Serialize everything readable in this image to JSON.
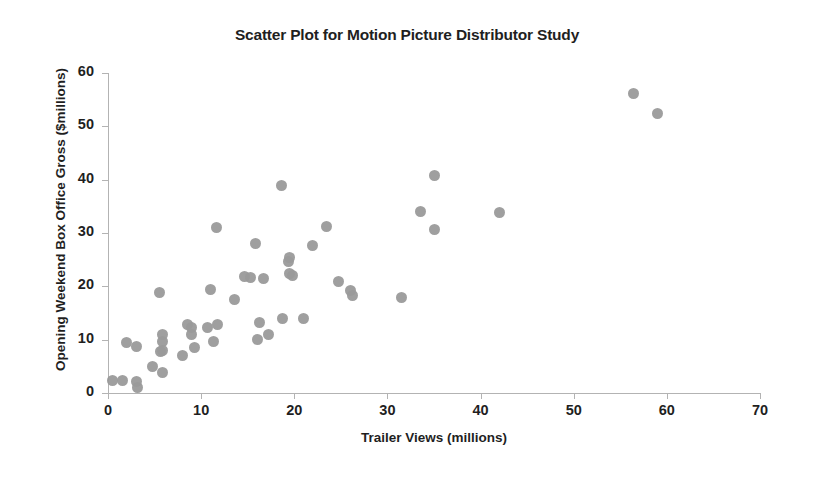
{
  "chart_data": {
    "type": "scatter",
    "title": "Scatter Plot for Motion Picture Distributor Study",
    "xlabel": "Trailer Views (millions)",
    "ylabel": "Opening Weekend Box Office Gross ($millions)",
    "xlim": [
      0,
      70
    ],
    "ylim": [
      0,
      60
    ],
    "xticks": [
      0,
      10,
      20,
      30,
      40,
      50,
      60,
      70
    ],
    "yticks": [
      0,
      10,
      20,
      30,
      40,
      50,
      60
    ],
    "grid": false,
    "legend": null,
    "marker": {
      "shape": "circle",
      "color": "#9a9a9a",
      "size": 11
    },
    "series": [
      {
        "name": "Motion pictures",
        "points": [
          [
            0.5,
            2.4
          ],
          [
            1.6,
            2.3
          ],
          [
            2.0,
            9.4
          ],
          [
            3.1,
            8.8
          ],
          [
            3.1,
            2.1
          ],
          [
            3.2,
            1.1
          ],
          [
            4.8,
            4.9
          ],
          [
            5.5,
            18.8
          ],
          [
            5.6,
            7.7
          ],
          [
            5.8,
            9.6
          ],
          [
            5.8,
            10.9
          ],
          [
            5.9,
            8.0
          ],
          [
            5.9,
            3.8
          ],
          [
            8.0,
            7.1
          ],
          [
            8.5,
            12.8
          ],
          [
            9.0,
            12.2
          ],
          [
            9.0,
            10.9
          ],
          [
            9.3,
            8.6
          ],
          [
            10.7,
            12.2
          ],
          [
            11.0,
            19.5
          ],
          [
            11.3,
            9.6
          ],
          [
            11.7,
            31.0
          ],
          [
            11.8,
            12.8
          ],
          [
            13.6,
            17.5
          ],
          [
            14.7,
            21.8
          ],
          [
            15.3,
            21.6
          ],
          [
            15.8,
            28.0
          ],
          [
            16.0,
            10.0
          ],
          [
            16.3,
            13.3
          ],
          [
            16.7,
            21.4
          ],
          [
            17.2,
            11.0
          ],
          [
            18.6,
            39.0
          ],
          [
            18.7,
            14.0
          ],
          [
            19.4,
            24.6
          ],
          [
            19.5,
            25.5
          ],
          [
            19.8,
            22.0
          ],
          [
            19.5,
            22.5
          ],
          [
            21.0,
            14.0
          ],
          [
            22.0,
            27.7
          ],
          [
            23.5,
            31.3
          ],
          [
            24.7,
            21.0
          ],
          [
            26.0,
            19.3
          ],
          [
            26.3,
            18.3
          ],
          [
            31.5,
            18.0
          ],
          [
            33.5,
            34.0
          ],
          [
            35.0,
            40.7
          ],
          [
            35.0,
            30.7
          ],
          [
            42.0,
            33.8
          ],
          [
            56.4,
            56.1
          ],
          [
            59.0,
            52.5
          ]
        ]
      }
    ]
  }
}
